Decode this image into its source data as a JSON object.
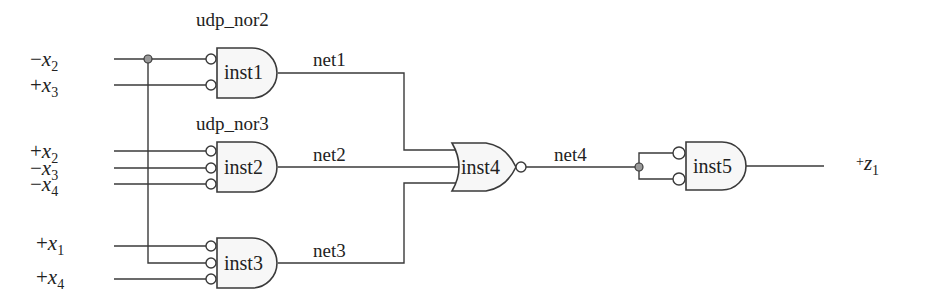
{
  "diagram": {
    "type": "logic-circuit",
    "primitives": {
      "udp1": "udp_nor2",
      "udp2": "udp_nor3"
    },
    "inputs": [
      {
        "sign": "−",
        "var": "x",
        "sub": "2",
        "gate": "inst1"
      },
      {
        "sign": "+",
        "var": "x",
        "sub": "3",
        "gate": "inst1"
      },
      {
        "sign": "+",
        "var": "x",
        "sub": "2",
        "gate": "inst2"
      },
      {
        "sign": "−",
        "var": "x",
        "sub": "3",
        "gate": "inst2"
      },
      {
        "sign": "−",
        "var": "x",
        "sub": "4",
        "gate": "inst2"
      },
      {
        "sign": "+",
        "var": "x",
        "sub": "1",
        "gate": "inst3"
      },
      {
        "sign": "+",
        "var": "x",
        "sub": "4",
        "gate": "inst3"
      }
    ],
    "gates": [
      {
        "name": "inst1",
        "kind": "AND with inverted inputs (udp_nor2)",
        "inputs": 2
      },
      {
        "name": "inst2",
        "kind": "AND with inverted inputs (udp_nor3)",
        "inputs": 3
      },
      {
        "name": "inst3",
        "kind": "AND with inverted inputs",
        "inputs": 3
      },
      {
        "name": "inst4",
        "kind": "NOR",
        "inputs": 3
      },
      {
        "name": "inst5",
        "kind": "AND with inverted inputs",
        "inputs": 2
      }
    ],
    "nets": [
      "net1",
      "net2",
      "net3",
      "net4"
    ],
    "output": {
      "sign": "+",
      "var": "z",
      "sub": "1"
    },
    "colors": {
      "wire": "#3a3a3a",
      "gate_fill": "#f7f7f7",
      "junction": "#9a9a9a"
    }
  }
}
